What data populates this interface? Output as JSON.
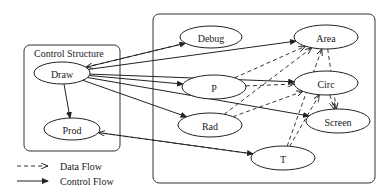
{
  "diagram": {
    "containers": [
      {
        "id": "control",
        "label": "Control Structure",
        "x": 24,
        "y": 45,
        "w": 96,
        "h": 106
      },
      {
        "id": "data",
        "label": "",
        "x": 153,
        "y": 14,
        "w": 222,
        "h": 169
      }
    ],
    "nodes": [
      {
        "id": "Draw",
        "label": "Draw",
        "cx": 62,
        "cy": 73,
        "rx": 28,
        "ry": 11
      },
      {
        "id": "Prod",
        "label": "Prod",
        "cx": 72,
        "cy": 129,
        "rx": 28,
        "ry": 11
      },
      {
        "id": "Debug",
        "label": "Debug",
        "cx": 211,
        "cy": 37,
        "rx": 31,
        "ry": 11
      },
      {
        "id": "Area",
        "label": "Area",
        "cx": 326,
        "cy": 37,
        "rx": 32,
        "ry": 12
      },
      {
        "id": "P",
        "label": "P",
        "cx": 214,
        "cy": 87,
        "rx": 32,
        "ry": 12
      },
      {
        "id": "Circ",
        "label": "Circ",
        "cx": 326,
        "cy": 83,
        "rx": 32,
        "ry": 12
      },
      {
        "id": "Rad",
        "label": "Rad",
        "cx": 210,
        "cy": 125,
        "rx": 32,
        "ry": 12
      },
      {
        "id": "Screen",
        "label": "Screen",
        "cx": 338,
        "cy": 121,
        "rx": 32,
        "ry": 12
      },
      {
        "id": "T",
        "label": "T",
        "cx": 283,
        "cy": 158,
        "rx": 32,
        "ry": 12
      }
    ],
    "control_edges": [
      {
        "from": "Draw",
        "to": "Debug"
      },
      {
        "from": "Draw",
        "to": "Area"
      },
      {
        "from": "Draw",
        "to": "P"
      },
      {
        "from": "Draw",
        "to": "Circ"
      },
      {
        "from": "Draw",
        "to": "Rad"
      },
      {
        "from": "Draw",
        "to": "Screen"
      },
      {
        "from": "Draw",
        "to": "Prod"
      },
      {
        "from": "Prod",
        "to": "T"
      }
    ],
    "data_edges": [
      {
        "from": "Debug",
        "to": "Draw"
      },
      {
        "from": "T",
        "to": "Prod"
      },
      {
        "from": "P",
        "to": "Area"
      },
      {
        "from": "P",
        "to": "Circ"
      },
      {
        "from": "Rad",
        "to": "Area"
      },
      {
        "from": "Rad",
        "to": "Circ"
      },
      {
        "from": "T",
        "to": "Area"
      },
      {
        "from": "T",
        "to": "Circ"
      },
      {
        "from": "Area",
        "to": "Screen"
      },
      {
        "from": "Circ",
        "to": "Screen"
      }
    ],
    "legend": {
      "data_flow": "Data Flow",
      "control_flow": "Control Flow"
    }
  }
}
